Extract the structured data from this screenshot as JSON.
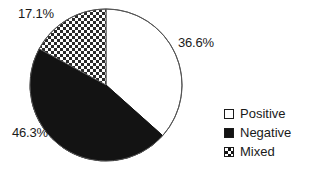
{
  "chart_data": {
    "type": "pie",
    "title": "",
    "categories": [
      "Positive",
      "Negative",
      "Mixed"
    ],
    "values": [
      36.6,
      46.3,
      17.1
    ],
    "value_labels": [
      "36.6%",
      "46.3%",
      "17.1%"
    ],
    "colors": [
      "#ffffff",
      "#131313",
      "#ffffff"
    ],
    "fill_patterns": [
      "solid-white",
      "solid-black",
      "crosshatch"
    ],
    "start_angle_deg": 0,
    "direction": "clockwise",
    "legend_position": "right",
    "grid": false,
    "xlabel": "",
    "ylabel": ""
  },
  "labels": {
    "positive_pct": "36.6%",
    "negative_pct": "46.3%",
    "mixed_pct": "17.1%"
  },
  "legend": {
    "items": [
      {
        "label": "Positive",
        "swatch": "white-square-swatch"
      },
      {
        "label": "Negative",
        "swatch": "black-square-swatch"
      },
      {
        "label": "Mixed",
        "swatch": "crosshatch-square-swatch"
      }
    ]
  },
  "style": {
    "outline_color": "#555555",
    "text_color": "#1a1a1a",
    "background": "#ffffff"
  }
}
